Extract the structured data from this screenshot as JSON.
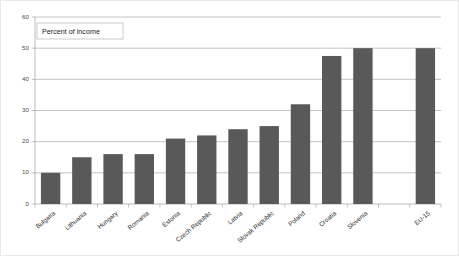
{
  "chart_data": {
    "type": "bar",
    "title": "",
    "subtitle": "",
    "annotation": "Percent of income",
    "xlabel": "",
    "ylabel": "",
    "ylim": [
      0,
      60
    ],
    "yticks": [
      0,
      10,
      20,
      30,
      40,
      50,
      60
    ],
    "ytick_labels": [
      "0",
      "10",
      "20",
      "30",
      "40",
      "50",
      "60"
    ],
    "grid": true,
    "legend": false,
    "legend_position": "none",
    "categories": [
      "Bulgaria",
      "Lithuania",
      "Hungary",
      "Romania",
      "Estonia",
      "Czech Republic",
      "Latvia",
      "Slovak Republic",
      "Poland",
      "Croatia",
      "Slovenia",
      "",
      "EU-15"
    ],
    "values": [
      10,
      15,
      16,
      16,
      21,
      22,
      24,
      25,
      32,
      47.5,
      50,
      null,
      50
    ],
    "bar_color": "#595959",
    "gridline_color": "#a9a9a9",
    "background_color": "#ffffff"
  },
  "axis": {
    "y_tick_labels": [
      "60",
      "50",
      "40",
      "30",
      "20",
      "10",
      "0"
    ]
  },
  "annotation_box": {
    "text": "Percent of income"
  }
}
